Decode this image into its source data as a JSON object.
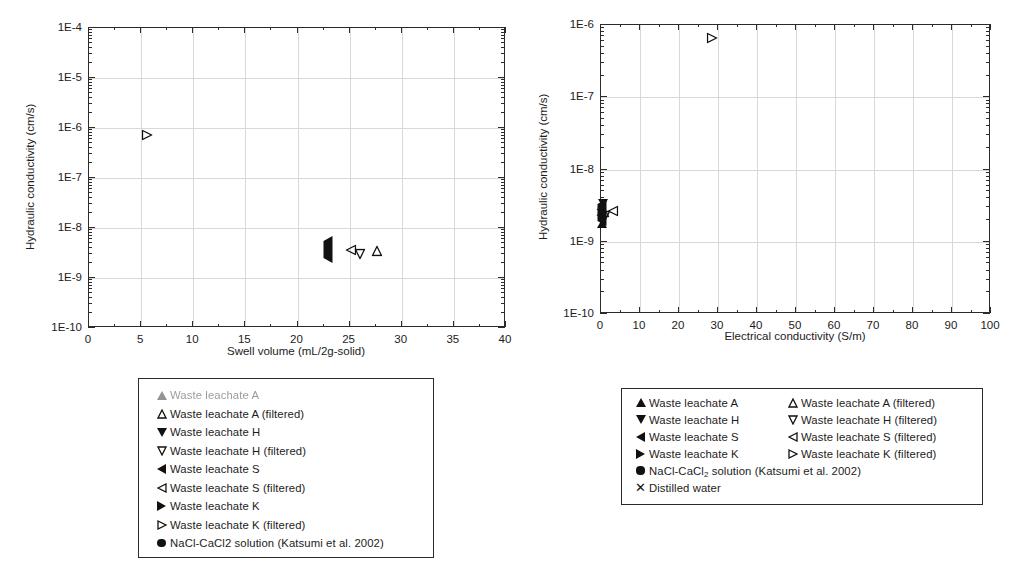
{
  "chart_data": [
    {
      "id": "left",
      "type": "scatter",
      "title": "",
      "xlabel": "Swell volume (mL/2g-solid)",
      "ylabel": "Hydraulic conductivity (cm/s)",
      "xlim": [
        0,
        40
      ],
      "ylim": [
        1e-10,
        0.0001
      ],
      "yscale": "log",
      "xticks": [
        0,
        5,
        10,
        15,
        20,
        25,
        30,
        35,
        40
      ],
      "xticklabels": [
        "0",
        "5",
        "10",
        "15",
        "20",
        "25",
        "30",
        "35",
        "40"
      ],
      "yticks": [
        1e-10,
        1e-09,
        1e-08,
        1e-07,
        1e-06,
        1e-05,
        0.0001
      ],
      "yticklabels": [
        "1E-10",
        "1E-9",
        "1E-8",
        "1E-7",
        "1E-6",
        "1E-5",
        "1E-4"
      ],
      "grid": true,
      "legend_position": "below",
      "series": [
        {
          "name": "NaCl-CaCl2 solution (Katsumi et al. 2002)",
          "marker": "circle-filled",
          "points": [
            {
              "x": 8.1,
              "y": 3.4e-07
            },
            {
              "x": 7.1,
              "y": 9e-08
            },
            {
              "x": 7.9,
              "y": 1.05e-07
            },
            {
              "x": 8.1,
              "y": 8e-08
            },
            {
              "x": 8.5,
              "y": 5.6e-08
            },
            {
              "x": 8.2,
              "y": 4.6e-08
            },
            {
              "x": 8.2,
              "y": 3.9e-08
            },
            {
              "x": 7.8,
              "y": 1.45e-08
            },
            {
              "x": 8.6,
              "y": 1.45e-08
            },
            {
              "x": 9.6,
              "y": 2e-08
            },
            {
              "x": 9.9,
              "y": 1.6e-08
            },
            {
              "x": 10.1,
              "y": 1.9e-08
            },
            {
              "x": 10.4,
              "y": 1.4e-08
            },
            {
              "x": 14.0,
              "y": 7.2e-09
            }
          ]
        },
        {
          "name": "Waste leachate K (filtered)",
          "marker": "triangle-right-open",
          "points": [
            {
              "x": 5.7,
              "y": 7e-07
            }
          ]
        },
        {
          "name": "Waste leachate S",
          "marker": "triangle-left-filled",
          "points": [
            {
              "x": 23.0,
              "y": 3.4e-09
            }
          ]
        },
        {
          "name": "Waste leachate S (filtered)",
          "marker": "triangle-left-open",
          "points": [
            {
              "x": 25.2,
              "y": 3.4e-09
            }
          ]
        },
        {
          "name": "Waste leachate H (filtered)",
          "marker": "triangle-down-open",
          "points": [
            {
              "x": 26.1,
              "y": 2.9e-09
            }
          ]
        },
        {
          "name": "Waste leachate A (filtered)",
          "marker": "triangle-up-open",
          "points": [
            {
              "x": 27.7,
              "y": 3.3e-09
            }
          ]
        }
      ]
    },
    {
      "id": "right",
      "type": "scatter",
      "title": "",
      "xlabel": "Electrical conductivity (S/m)",
      "ylabel": "Hydraulic conductivity (cm/s)",
      "xlim": [
        0,
        100
      ],
      "ylim": [
        1e-10,
        1e-06
      ],
      "yscale": "log",
      "xticks": [
        0,
        10,
        20,
        30,
        40,
        50,
        60,
        70,
        80,
        90,
        100
      ],
      "xticklabels": [
        "0",
        "10",
        "20",
        "30",
        "40",
        "50",
        "60",
        "70",
        "80",
        "90",
        "100"
      ],
      "yticks": [
        1e-10,
        1e-09,
        1e-08,
        1e-07,
        1e-06
      ],
      "yticklabels": [
        "1E-10",
        "1E-9",
        "1E-8",
        "1E-7",
        "1E-6"
      ],
      "grid": true,
      "legend_position": "below",
      "series": [
        {
          "name": "NaCl-CaCl2 solution (Katsumi et al. 2002)",
          "marker": "circle-filled",
          "points": [
            {
              "x": 11.0,
              "y": 1.45e-08
            },
            {
              "x": 13.3,
              "y": 1.8e-08
            },
            {
              "x": 13.5,
              "y": 1.25e-08
            },
            {
              "x": 16.0,
              "y": 6.2e-09
            },
            {
              "x": 19.6,
              "y": 3.5e-08
            },
            {
              "x": 23.3,
              "y": 1.45e-08
            },
            {
              "x": 39.8,
              "y": 4.1e-08
            },
            {
              "x": 43.0,
              "y": 5.6e-08
            },
            {
              "x": 53.5,
              "y": 5.3e-08
            },
            {
              "x": 63.0,
              "y": 3.4e-07
            },
            {
              "x": 68.0,
              "y": 9.3e-08
            },
            {
              "x": 84.5,
              "y": 9.9e-08
            }
          ]
        },
        {
          "name": "Waste leachate K (filtered)",
          "marker": "triangle-right-open",
          "points": [
            {
              "x": 28.8,
              "y": 6.3e-07
            }
          ]
        },
        {
          "name": "Waste leachate A",
          "marker": "triangle-up-filled",
          "points": [
            {
              "x": 0.6,
              "y": 2.6e-09
            }
          ]
        },
        {
          "name": "Waste leachate H",
          "marker": "triangle-down-filled",
          "points": [
            {
              "x": 0.7,
              "y": 2.1e-09
            }
          ]
        },
        {
          "name": "Waste leachate S",
          "marker": "triangle-left-filled",
          "points": [
            {
              "x": 0.4,
              "y": 2.4e-09
            }
          ]
        },
        {
          "name": "Waste leachate S (filtered)",
          "marker": "triangle-left-open",
          "points": [
            {
              "x": 3.4,
              "y": 2.6e-09
            }
          ]
        },
        {
          "name": "Waste leachate A (filtered)",
          "marker": "triangle-up-open",
          "points": [
            {
              "x": 1.1,
              "y": 2.5e-09
            }
          ]
        },
        {
          "name": "Waste leachate H (filtered)",
          "marker": "triangle-down-open",
          "points": [
            {
              "x": 1.3,
              "y": 2.2e-09
            }
          ]
        },
        {
          "name": "Distilled water",
          "marker": "x",
          "points": [
            {
              "x": 0.2,
              "y": 2.5e-09
            }
          ]
        }
      ]
    }
  ],
  "left_legend": {
    "rows": [
      {
        "marker": "triangle-up-filled",
        "label": "Waste leachate A",
        "faded": true
      },
      {
        "marker": "triangle-up-open",
        "label": "Waste leachate A (filtered)",
        "faded": false
      },
      {
        "marker": "triangle-down-filled",
        "label": "Waste leachate H",
        "faded": false
      },
      {
        "marker": "triangle-down-open",
        "label": "Waste leachate H (filtered)",
        "faded": false
      },
      {
        "marker": "triangle-left-filled",
        "label": "Waste leachate S",
        "faded": false
      },
      {
        "marker": "triangle-left-open",
        "label": "Waste leachate S (filtered)",
        "faded": false
      },
      {
        "marker": "triangle-right-filled",
        "label": "Waste leachate K",
        "faded": false
      },
      {
        "marker": "triangle-right-open",
        "label": "Waste leachate K (filtered)",
        "faded": false
      },
      {
        "marker": "circle-filled",
        "label": "NaCl-CaCl2 solution (Katsumi et al. 2002)",
        "faded": false
      }
    ]
  },
  "right_legend": {
    "col1": [
      {
        "marker": "triangle-up-filled",
        "label": "Waste leachate A"
      },
      {
        "marker": "triangle-down-filled",
        "label": "Waste leachate H"
      },
      {
        "marker": "triangle-left-filled",
        "label": "Waste leachate S"
      },
      {
        "marker": "triangle-right-filled",
        "label": "Waste leachate K"
      }
    ],
    "col2": [
      {
        "marker": "triangle-up-open",
        "label": "Waste leachate A (filtered)"
      },
      {
        "marker": "triangle-down-open",
        "label": "Waste leachate H (filtered)"
      },
      {
        "marker": "triangle-left-open",
        "label": "Waste leachate S (filtered)"
      },
      {
        "marker": "triangle-right-open",
        "label": "Waste leachate K (filtered)"
      }
    ],
    "wide": [
      {
        "marker": "circle-filled",
        "label_html": "NaCl-CaCl<sub>2</sub> solution (Katsumi et al. 2002)"
      },
      {
        "marker": "x",
        "label_html": "Distilled water"
      }
    ]
  },
  "colors": {
    "marker": "#111111",
    "axis": "#2b2b2b",
    "grid": "#d9d9d9",
    "background": "#ffffff"
  }
}
